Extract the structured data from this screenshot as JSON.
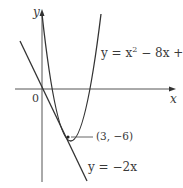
{
  "figure": {
    "axes": {
      "x_label": "x",
      "y_label": "y",
      "origin_label": "0"
    },
    "curves": [
      {
        "name": "parabola",
        "equation_prefix": "y = x",
        "equation_exponent": "2",
        "equation_suffix": " − 8x + 9"
      },
      {
        "name": "tangent-line",
        "equation": "y = −2x"
      }
    ],
    "point": {
      "label": "(3, −6)",
      "x": 3,
      "y": -6
    },
    "colors": {
      "stroke": "#3a3a3a",
      "background": "#ffffff"
    }
  }
}
